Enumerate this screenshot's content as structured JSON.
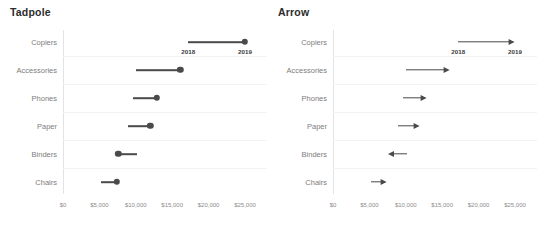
{
  "charts": [
    {
      "id": "tadpole",
      "title": "Tadpole",
      "mark": "tadpole",
      "categories": [
        "Copiers",
        "Accessories",
        "Phones",
        "Paper",
        "Binders",
        "Chairs"
      ],
      "tick_labels": [
        "$0",
        "$5,000",
        "$10,000",
        "$15,000",
        "$20,000",
        "$25,000"
      ],
      "tick_values": [
        0,
        5000,
        10000,
        15000,
        20000,
        25000
      ],
      "year_start_label": "2018",
      "year_end_label": "2019",
      "series": [
        {
          "name": "2018",
          "values": [
            17200,
            10000,
            9600,
            8900,
            10200,
            5200
          ]
        },
        {
          "name": "2019",
          "values": [
            25000,
            16100,
            12900,
            12000,
            7600,
            7400
          ]
        }
      ]
    },
    {
      "id": "arrow",
      "title": "Arrow",
      "mark": "arrow",
      "categories": [
        "Copiers",
        "Accessories",
        "Phones",
        "Paper",
        "Binders",
        "Chairs"
      ],
      "tick_labels": [
        "$0",
        "$5,000",
        "$10,000",
        "$15,000",
        "$20,000",
        "$25,000"
      ],
      "tick_values": [
        0,
        5000,
        10000,
        15000,
        20000,
        25000
      ],
      "year_start_label": "2018",
      "year_end_label": "2019",
      "series": [
        {
          "name": "2018",
          "values": [
            17200,
            10000,
            9600,
            8900,
            10200,
            5200
          ]
        },
        {
          "name": "2019",
          "values": [
            25000,
            16100,
            12900,
            12000,
            7600,
            7400
          ]
        }
      ]
    }
  ],
  "chart_data": {
    "type": "line",
    "subtitle": "",
    "xlabel": "",
    "ylabel": "",
    "xlim": [
      0,
      25000
    ],
    "grid": true,
    "legend": "none",
    "x_tick_labels": [
      "$0",
      "$5,000",
      "$10,000",
      "$15,000",
      "$20,000",
      "$25,000"
    ],
    "x_ticks": [
      0,
      5000,
      10000,
      15000,
      20000,
      25000
    ],
    "categories": [
      "Copiers",
      "Accessories",
      "Phones",
      "Paper",
      "Binders",
      "Chairs"
    ],
    "series": [
      {
        "name": "2018",
        "values": [
          17200,
          10000,
          9600,
          8900,
          10200,
          5200
        ]
      },
      {
        "name": "2019",
        "values": [
          25000,
          16100,
          12900,
          12000,
          7600,
          7400
        ]
      }
    ],
    "annotations": [
      {
        "text": "2018",
        "category": "Copiers",
        "value": 17200,
        "panel": "Tadpole"
      },
      {
        "text": "2019",
        "category": "Copiers",
        "value": 25000,
        "panel": "Tadpole"
      },
      {
        "text": "2018",
        "category": "Copiers",
        "value": 17200,
        "panel": "Arrow"
      },
      {
        "text": "2019",
        "category": "Copiers",
        "value": 25000,
        "panel": "Arrow"
      }
    ],
    "panels": [
      {
        "title": "Tadpole",
        "mark": "tadpole",
        "note": "line from 2018 value to filled dot at 2019 value"
      },
      {
        "title": "Arrow",
        "mark": "arrow",
        "note": "arrow shaft from 2018 value to arrowhead at 2019 value"
      }
    ],
    "colors": {
      "mark": "#4a4a4a",
      "grid": "#f2f2f2",
      "axis": "#e3e3e3",
      "text": "#7d7d7d",
      "title": "#2b2b2b"
    }
  }
}
